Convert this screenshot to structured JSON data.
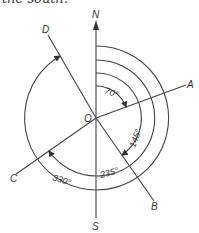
{
  "caption": "the south.",
  "diagram": {
    "origin_label": "O",
    "directions": {
      "north": "N",
      "south": "S"
    },
    "lines": [
      {
        "label": "A",
        "bearing": "70°"
      },
      {
        "label": "B",
        "bearing": "145°"
      },
      {
        "label": "C",
        "bearing": "235°"
      },
      {
        "label": "D",
        "bearing": "330°"
      }
    ],
    "angles": [
      "70°",
      "145°",
      "235°",
      "330°"
    ]
  }
}
